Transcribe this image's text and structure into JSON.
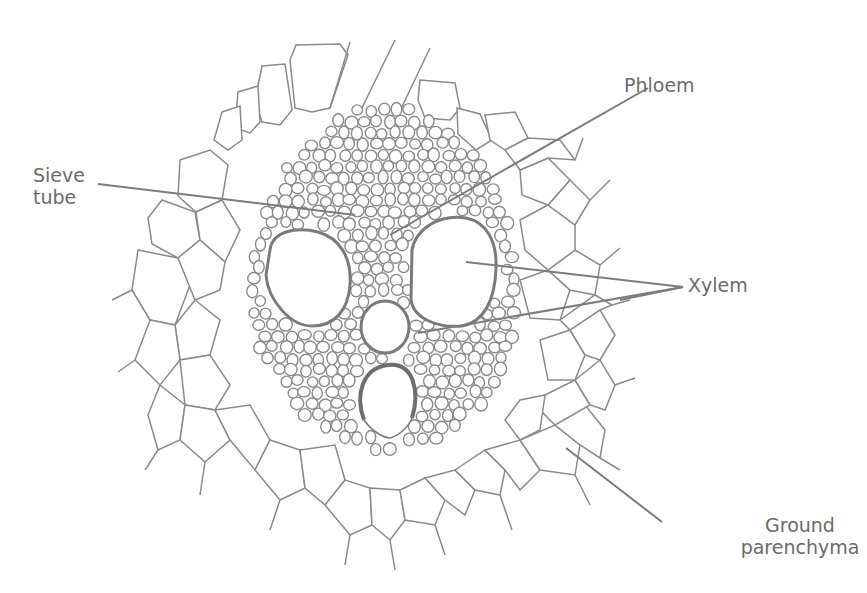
{
  "figure": {
    "colors": {
      "background": "#ffffff",
      "lines": "#8a8a8a",
      "label_text": "#6b6b6b"
    }
  },
  "labels": {
    "phloem": "Phloem",
    "sieve_tube": "Sieve\ntube",
    "xylem": "Xylem",
    "ground_parenchyma": "Ground\nparenchyma"
  }
}
